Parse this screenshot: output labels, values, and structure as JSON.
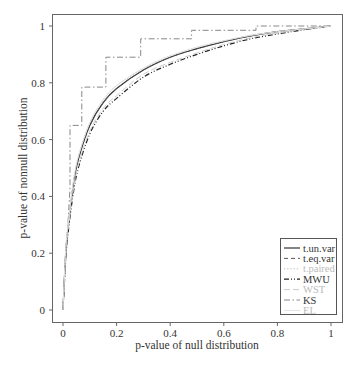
{
  "chart_data": {
    "type": "line",
    "title": "",
    "xlabel": "p-value of null distribution",
    "ylabel": "p-value of nonnull distribution",
    "xlim": [
      0,
      1
    ],
    "ylim": [
      0,
      1
    ],
    "xticks": [
      "0",
      "0.2",
      "0.4",
      "0.6",
      "0.8",
      "1"
    ],
    "yticks": [
      "0",
      "0.2",
      "0.4",
      "0.6",
      "0.8",
      "1"
    ],
    "grid": false,
    "legend_position": "lower right",
    "series": [
      {
        "name": "t.un.var",
        "style": "solid",
        "color": "#333333",
        "x": [
          0,
          0.01,
          0.02,
          0.04,
          0.06,
          0.1,
          0.15,
          0.2,
          0.3,
          0.4,
          0.5,
          0.6,
          0.7,
          0.8,
          0.9,
          1.0
        ],
        "y": [
          0,
          0.2,
          0.3,
          0.45,
          0.54,
          0.65,
          0.73,
          0.78,
          0.845,
          0.89,
          0.92,
          0.945,
          0.965,
          0.98,
          0.99,
          1.0
        ]
      },
      {
        "name": "t.eq.var",
        "style": "dashed",
        "color": "#555555",
        "x": [
          0,
          0.01,
          0.02,
          0.04,
          0.06,
          0.1,
          0.15,
          0.2,
          0.3,
          0.4,
          0.5,
          0.6,
          0.7,
          0.8,
          0.9,
          1.0
        ],
        "y": [
          0,
          0.2,
          0.3,
          0.45,
          0.54,
          0.65,
          0.73,
          0.78,
          0.845,
          0.89,
          0.92,
          0.945,
          0.965,
          0.98,
          0.99,
          1.0
        ]
      },
      {
        "name": "t.paired",
        "style": "dotted",
        "color": "#bbbbbb",
        "x": [
          0,
          0.01,
          0.02,
          0.04,
          0.06,
          0.1,
          0.15,
          0.2,
          0.3,
          0.4,
          0.5,
          0.6,
          0.7,
          0.8,
          0.9,
          1.0
        ],
        "y": [
          0,
          0.21,
          0.31,
          0.46,
          0.55,
          0.66,
          0.74,
          0.79,
          0.85,
          0.895,
          0.925,
          0.948,
          0.967,
          0.98,
          0.99,
          1.0
        ]
      },
      {
        "name": "MWU",
        "style": "dashdotdot",
        "color": "#222222",
        "x": [
          0,
          0.01,
          0.02,
          0.04,
          0.06,
          0.1,
          0.15,
          0.2,
          0.3,
          0.4,
          0.5,
          0.6,
          0.7,
          0.8,
          0.9,
          1.0
        ],
        "y": [
          0,
          0.18,
          0.28,
          0.42,
          0.51,
          0.62,
          0.7,
          0.745,
          0.82,
          0.865,
          0.9,
          0.93,
          0.955,
          0.972,
          0.987,
          1.0
        ]
      },
      {
        "name": "WST",
        "style": "longdash",
        "color": "#cccccc",
        "x": [
          0,
          0.01,
          0.02,
          0.04,
          0.06,
          0.1,
          0.15,
          0.2,
          0.3,
          0.4,
          0.5,
          0.6,
          0.7,
          0.8,
          0.9,
          1.0
        ],
        "y": [
          0,
          0.19,
          0.29,
          0.43,
          0.52,
          0.63,
          0.71,
          0.755,
          0.83,
          0.872,
          0.905,
          0.935,
          0.958,
          0.975,
          0.988,
          1.0
        ]
      },
      {
        "name": "KS",
        "style": "dashdot",
        "color": "#888888",
        "step": true,
        "x": [
          0,
          0.026,
          0.026,
          0.07,
          0.07,
          0.16,
          0.16,
          0.29,
          0.29,
          0.48,
          0.48,
          0.72,
          0.72,
          1.0
        ],
        "y": [
          0,
          0.43,
          0.65,
          0.65,
          0.785,
          0.785,
          0.89,
          0.89,
          0.955,
          0.955,
          0.985,
          0.985,
          1.0,
          1.0
        ]
      },
      {
        "name": "EL",
        "style": "solid",
        "color": "#e2e2e2",
        "x": [
          0,
          0.01,
          0.02,
          0.04,
          0.06,
          0.1,
          0.15,
          0.2,
          0.3,
          0.4,
          0.5,
          0.6,
          0.7,
          0.8,
          0.9,
          1.0
        ],
        "y": [
          0,
          0.21,
          0.31,
          0.46,
          0.55,
          0.66,
          0.74,
          0.79,
          0.852,
          0.895,
          0.925,
          0.948,
          0.967,
          0.98,
          0.99,
          1.0
        ]
      }
    ]
  }
}
